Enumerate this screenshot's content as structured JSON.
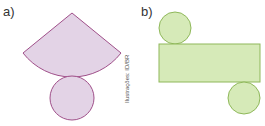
{
  "labels": {
    "a": "a)",
    "b": "b)"
  },
  "credit": "Ilustrações: ID/BR",
  "colors": {
    "cone_fill": "#e3d3e6",
    "cone_stroke": "#a0508a",
    "cyl_fill": "#d6eab8",
    "cyl_stroke": "#8fb85a"
  },
  "figures": {
    "a": {
      "description": "Net of a cone: circular sector with a circle base"
    },
    "b": {
      "description": "Net of a cylinder: rectangle with two circles"
    }
  }
}
